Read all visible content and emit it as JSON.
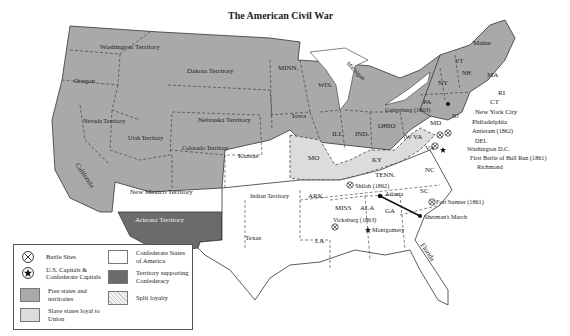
{
  "title": "The American Civil War",
  "colors": {
    "free": "#a9a9a9",
    "slave_loyal": "#dcdcdc",
    "confederate": "#ffffff",
    "territory_confederacy": "#6b6b6b",
    "border": "#333333"
  },
  "regions": {
    "washington": "Washington Territory",
    "oregon": "Oregon",
    "dakota": "Dakota Territory",
    "nevada": "Nevada Territory",
    "utah": "Utah Territory",
    "nebraska": "Nebraska Territory",
    "colorado": "Colorado Territory",
    "kansas": "Kansas",
    "california": "California",
    "new_mexico": "New Mexico Territory",
    "arizona": "Arizona Territory",
    "minn": "MINN.",
    "wis": "WIS.",
    "michigan": "Michigan",
    "iowa": "Iowa",
    "ill": "ILL.",
    "ind": "IND.",
    "ohio": "OHIO",
    "mo": "MO",
    "ky": "KY",
    "wva": "W VA",
    "md": "MD",
    "del": "DEL",
    "va": "VA",
    "pa": "PA",
    "ny": "NY",
    "vt": "VT",
    "nh": "NH",
    "maine": "Maine",
    "ma": "MA",
    "ri": "RI",
    "ct": "CT",
    "nj": "NJ",
    "indian": "Indian Territory",
    "texas": "Texas",
    "ark": "ARK.",
    "la": "LA",
    "miss": "MISS",
    "ala": "ALA",
    "tenn": "TENN.",
    "ga": "GA",
    "sc": "SC",
    "nc": "NC",
    "florida": "Florida"
  },
  "places": {
    "gettysburg": "Gettysburg (1863)",
    "nyc": "New York City",
    "philadelphia": "Philadelphia",
    "antietam": "Antietam (1862)",
    "washington_dc": "Washington D.C.",
    "bull_run": "First Battle of Bull Run (1861)",
    "richmond": "Richmond",
    "shiloh": "Shiloh (1862)",
    "atlanta": "Atlanta",
    "fort_sumter": "Fort Sumter (1861)",
    "shermans_march": "Sherman's March",
    "vicksburg": "Vicksburg (1863)",
    "montgomery": "Montgomery"
  },
  "legend": {
    "items": [
      {
        "icon": "battle-site-icon",
        "label": "Battle Sites"
      },
      {
        "icon": "capital-star-icon",
        "label": "U.S. Capitals & Confederate Capitals"
      },
      {
        "swatch": "free",
        "label": "Free states and territories"
      },
      {
        "swatch": "slave_loyal",
        "label": "Slave states loyal to Union"
      },
      {
        "swatch": "confederate",
        "label": "Confederate States of America"
      },
      {
        "swatch": "territory_confederacy",
        "label": "Territory supporting Confederacy"
      },
      {
        "swatch": "split",
        "label": "Split loyalty"
      }
    ]
  }
}
